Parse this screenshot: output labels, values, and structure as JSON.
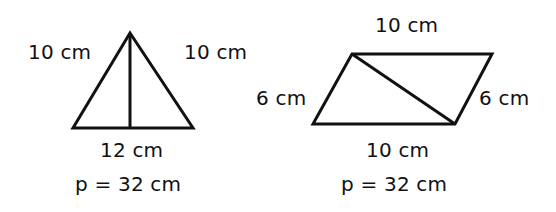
{
  "figures": [
    {
      "shape": "isosceles-triangle",
      "labels": {
        "left_side": "10 cm",
        "right_side": "10 cm",
        "base": "12 cm",
        "perimeter": "p = 32 cm"
      },
      "sides_cm": [
        10,
        10,
        12
      ],
      "perimeter_cm": 32,
      "has_altitude": true
    },
    {
      "shape": "parallelogram",
      "labels": {
        "top_side": "10 cm",
        "left_side": "6 cm",
        "right_side": "6 cm",
        "bottom_side": "10 cm",
        "perimeter": "p = 32 cm"
      },
      "sides_cm": [
        10,
        6,
        10,
        6
      ],
      "perimeter_cm": 32,
      "has_diagonal": true
    }
  ],
  "colors": {
    "stroke": "#111111",
    "background": "#ffffff"
  }
}
